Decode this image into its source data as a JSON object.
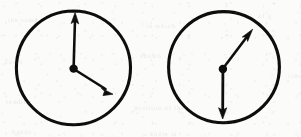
{
  "figure": {
    "width": 301,
    "height": 137,
    "background_color": "#fbfbfa",
    "ink_color": "#111111",
    "style": "hand-drawn scanned line art"
  },
  "clocks": [
    {
      "id": "clock-left",
      "label": "left-clock",
      "dial": {
        "center_x": 73.5,
        "center_y": 68,
        "radius": 57,
        "stroke_width": 3.1,
        "fill": "none",
        "stroke_color": "#111111"
      },
      "hub": {
        "center_x": 73.5,
        "center_y": 68,
        "radius": 4.2,
        "fill": "#111111"
      },
      "hands": [
        {
          "name": "minute-hand",
          "direction": "up",
          "tip_x": 75.0,
          "tip_y": 13.0,
          "angle_deg": 358,
          "length": 55,
          "stroke_width": 2.6,
          "arrowhead": true,
          "reads_clock_position": "12"
        },
        {
          "name": "hour-hand",
          "direction": "down-right",
          "tip_x": 112.0,
          "tip_y": 94.0,
          "angle_deg": 124,
          "length": 46,
          "stroke_width": 2.6,
          "arrowhead": true,
          "reads_clock_position": "4"
        }
      ]
    },
    {
      "id": "clock-right",
      "label": "right-clock",
      "dial": {
        "center_x": 224,
        "center_y": 67,
        "radius": 55,
        "stroke_width": 3.1,
        "fill": "none",
        "stroke_color": "#111111"
      },
      "hub": {
        "center_x": 223,
        "center_y": 69,
        "radius": 4.2,
        "fill": "#111111"
      },
      "hands": [
        {
          "name": "minute-hand",
          "direction": "up-right",
          "tip_x": 252.0,
          "tip_y": 30.0,
          "angle_deg": 37,
          "length": 48,
          "stroke_width": 2.6,
          "arrowhead": true,
          "reads_clock_position": "1-2"
        },
        {
          "name": "hour-hand",
          "direction": "down",
          "tip_x": 223.0,
          "tip_y": 118.0,
          "angle_deg": 180,
          "length": 49,
          "stroke_width": 2.8,
          "arrowhead": true,
          "reads_clock_position": "6"
        }
      ]
    }
  ],
  "ghost_marks": [
    {
      "text": "the same",
      "x": 8,
      "y": 16,
      "rotate": -0.6
    },
    {
      "text": "in which",
      "x": 146,
      "y": 22,
      "rotate": 0.4
    },
    {
      "text": "of a",
      "x": 258,
      "y": 12,
      "rotate": -0.3
    },
    {
      "text": "cases",
      "x": 5,
      "y": 58,
      "rotate": 0.5
    },
    {
      "text": "shown",
      "x": 140,
      "y": 52,
      "rotate": -0.4
    },
    {
      "text": "time",
      "x": 288,
      "y": 72,
      "rotate": 0.2
    },
    {
      "text": "reading",
      "x": 6,
      "y": 98,
      "rotate": -0.5
    },
    {
      "text": "position of the",
      "x": 134,
      "y": 104,
      "rotate": 0.3
    },
    {
      "text": "hands",
      "x": 12,
      "y": 128,
      "rotate": 0.4
    },
    {
      "text": "angle is",
      "x": 150,
      "y": 130,
      "rotate": -0.2
    }
  ]
}
